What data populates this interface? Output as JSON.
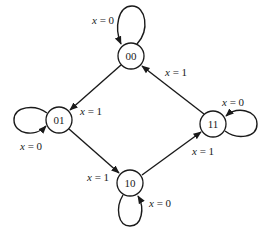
{
  "diagram": {
    "type": "state-diagram",
    "colors": {
      "stroke": "#1a1a1a",
      "background": "#ffffff"
    },
    "states": [
      {
        "id": "00",
        "label": "00",
        "x": 131,
        "y": 56
      },
      {
        "id": "01",
        "label": "01",
        "x": 59,
        "y": 120
      },
      {
        "id": "10",
        "label": "10",
        "x": 130,
        "y": 183
      },
      {
        "id": "11",
        "label": "11",
        "x": 213,
        "y": 124
      }
    ],
    "transitions": [
      {
        "from": "00",
        "to": "00",
        "var": "x",
        "eq": " = ",
        "val": "0"
      },
      {
        "from": "00",
        "to": "01",
        "var": "x",
        "eq": " = ",
        "val": "1"
      },
      {
        "from": "01",
        "to": "01",
        "var": "x",
        "eq": " = ",
        "val": "0"
      },
      {
        "from": "01",
        "to": "10",
        "var": "x",
        "eq": " = ",
        "val": "1"
      },
      {
        "from": "10",
        "to": "10",
        "var": "x",
        "eq": " = ",
        "val": "0"
      },
      {
        "from": "10",
        "to": "11",
        "var": "x",
        "eq": " = ",
        "val": "1"
      },
      {
        "from": "11",
        "to": "11",
        "var": "x",
        "eq": " = ",
        "val": "0"
      },
      {
        "from": "11",
        "to": "00",
        "var": "x",
        "eq": " = ",
        "val": "1"
      }
    ]
  }
}
